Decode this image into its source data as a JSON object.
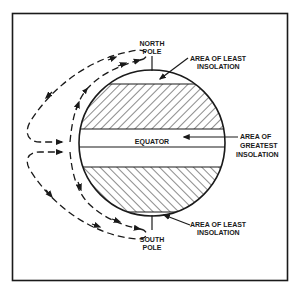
{
  "diagram": {
    "colors": {
      "ink": "#1a1a1a",
      "background": "#ffffff"
    },
    "labels": {
      "north_pole_line1": "NORTH",
      "north_pole_line2": "POLE",
      "south_pole_line1": "SOUTH",
      "south_pole_line2": "POLE",
      "equator": "EQUATOR",
      "least_top_line1": "AREA OF LEAST",
      "least_top_line2": "INSOLATION",
      "greatest_line1": "AREA  OF",
      "greatest_line2": "GREATEST",
      "greatest_line3": "INSOLATION",
      "least_bottom_line1": "AREA OF LEAST",
      "least_bottom_line2": "INSOLATION"
    },
    "regions": [
      {
        "name": "north-hatched-band",
        "pattern": "hatch-forward",
        "meaning": "area of least insolation"
      },
      {
        "name": "equatorial-band",
        "pattern": "clear",
        "meaning": "area of greatest insolation"
      },
      {
        "name": "south-hatched-band",
        "pattern": "hatch-backward",
        "meaning": "area of least insolation"
      }
    ],
    "circulation": [
      {
        "name": "northern-cell",
        "direction": "equator to north pole along surface, returning aloft to equator"
      },
      {
        "name": "southern-cell",
        "direction": "equator to south pole along surface, returning aloft to equator"
      }
    ]
  }
}
